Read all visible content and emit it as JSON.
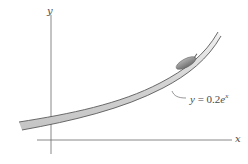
{
  "figure": {
    "axes": {
      "x_label": "x",
      "y_label": "y"
    },
    "curve": {
      "label_prefix": "y",
      "label_equals": " = 0.2",
      "label_base": "e",
      "label_exponent": "x",
      "equation_text": "y = 0.2e^x",
      "style": "double-line ribbon with gray fill"
    },
    "object": {
      "description": "small gray capsule-shaped object resting on the curve"
    },
    "colors": {
      "line": "#555555",
      "ribbon_fill": "#d9d9d9",
      "object_fill": "#8c8c8c",
      "text": "#4a4a4a"
    }
  }
}
